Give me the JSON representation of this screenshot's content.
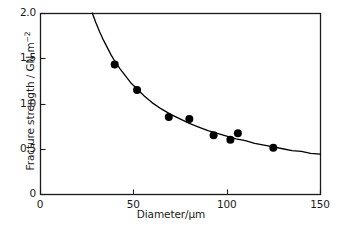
{
  "chart_data": {
    "type": "scatter",
    "title": "",
    "xlabel": "Diameter/μm",
    "ylabel_prefix": "Fracture strength / GN m",
    "ylabel_exponent": "−2",
    "xlim": [
      0,
      150
    ],
    "ylim": [
      0,
      2.0
    ],
    "xticks": [
      0,
      50,
      100,
      150
    ],
    "xtick_labels": [
      "0",
      "50",
      "100",
      "150"
    ],
    "yticks": [
      0,
      0.5,
      1.0,
      1.5,
      2.0
    ],
    "ytick_labels": [
      "0",
      "0.5",
      "1.0",
      "1.5",
      "2.0"
    ],
    "grid": false,
    "legend": false,
    "marker_color": "#000000",
    "line_color": "#000000",
    "axis_color": "#1a1a1a",
    "series": [
      {
        "name": "measured",
        "type": "scatter",
        "points": [
          {
            "x": 40,
            "y": 1.43
          },
          {
            "x": 52,
            "y": 1.15
          },
          {
            "x": 69,
            "y": 0.85
          },
          {
            "x": 80,
            "y": 0.83
          },
          {
            "x": 93,
            "y": 0.65
          },
          {
            "x": 102,
            "y": 0.6
          },
          {
            "x": 106,
            "y": 0.67
          },
          {
            "x": 125,
            "y": 0.51
          }
        ]
      },
      {
        "name": "fitted curve",
        "type": "line",
        "points": [
          {
            "x": 28.0,
            "y": 2.0
          },
          {
            "x": 30.0,
            "y": 1.89
          },
          {
            "x": 32.0,
            "y": 1.79
          },
          {
            "x": 34.0,
            "y": 1.7
          },
          {
            "x": 36.0,
            "y": 1.62
          },
          {
            "x": 38.0,
            "y": 1.54
          },
          {
            "x": 40.0,
            "y": 1.47
          },
          {
            "x": 43.0,
            "y": 1.38
          },
          {
            "x": 46.0,
            "y": 1.3
          },
          {
            "x": 49.0,
            "y": 1.22
          },
          {
            "x": 52.0,
            "y": 1.16
          },
          {
            "x": 56.0,
            "y": 1.08
          },
          {
            "x": 60.0,
            "y": 1.01
          },
          {
            "x": 65.0,
            "y": 0.94
          },
          {
            "x": 70.0,
            "y": 0.88
          },
          {
            "x": 75.0,
            "y": 0.83
          },
          {
            "x": 80.0,
            "y": 0.78
          },
          {
            "x": 85.0,
            "y": 0.74
          },
          {
            "x": 90.0,
            "y": 0.7
          },
          {
            "x": 95.0,
            "y": 0.67
          },
          {
            "x": 100.0,
            "y": 0.64
          },
          {
            "x": 105.0,
            "y": 0.61
          },
          {
            "x": 110.0,
            "y": 0.59
          },
          {
            "x": 115.0,
            "y": 0.56
          },
          {
            "x": 120.0,
            "y": 0.54
          },
          {
            "x": 125.0,
            "y": 0.52
          },
          {
            "x": 130.0,
            "y": 0.5
          },
          {
            "x": 135.0,
            "y": 0.48
          },
          {
            "x": 140.0,
            "y": 0.47
          },
          {
            "x": 145.0,
            "y": 0.45
          },
          {
            "x": 150.0,
            "y": 0.44
          }
        ]
      }
    ]
  },
  "axes": {
    "plot_left_px": 40,
    "plot_right_px": 320,
    "plot_top_px": 13,
    "plot_bottom_px": 194
  }
}
